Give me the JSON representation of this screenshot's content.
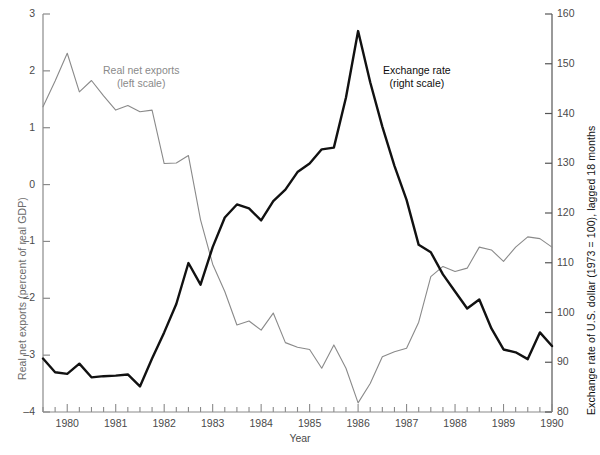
{
  "chart_data": {
    "type": "line",
    "title": "",
    "xlabel": "Year",
    "ylabel": "Real net exports (percent of real GDP)",
    "ylabel_right": "Exchange rate of U.S. dollar (1973 = 100), lagged 18 months",
    "xlim": [
      1979.5,
      1990.0
    ],
    "ylim": [
      -4,
      3
    ],
    "ylim_right": [
      80,
      160
    ],
    "grid": false,
    "legend_position": "inline-annotations",
    "x_ticks_major": [
      "1980",
      "1981",
      "1982",
      "1983",
      "1984",
      "1985",
      "1986",
      "1987",
      "1988",
      "1989",
      "1990"
    ],
    "x_tick_interval_minor": "quarterly",
    "y_ticks_left": [
      "3",
      "2",
      "1",
      "0",
      "–1",
      "–2",
      "–3",
      "–4"
    ],
    "y_ticks_right": [
      "160",
      "150",
      "140",
      "130",
      "120",
      "110",
      "100",
      "90",
      "80"
    ],
    "series": [
      {
        "name": "Real net exports (left scale)",
        "axis": "left",
        "color": "#8a8a8a",
        "label_line1": "Real net exports",
        "label_line2": "(left scale)",
        "x": [
          1979.5,
          1979.75,
          1980.0,
          1980.25,
          1980.5,
          1980.75,
          1981.0,
          1981.25,
          1981.5,
          1981.75,
          1982.0,
          1982.25,
          1982.5,
          1982.75,
          1983.0,
          1983.25,
          1983.5,
          1983.75,
          1984.0,
          1984.25,
          1984.5,
          1984.75,
          1985.0,
          1985.25,
          1985.5,
          1985.75,
          1986.0,
          1986.25,
          1986.5,
          1986.75,
          1987.0,
          1987.25,
          1987.5,
          1987.75,
          1988.0,
          1988.25,
          1988.5,
          1988.75,
          1989.0,
          1989.25,
          1989.5,
          1989.75,
          1990.0
        ],
        "y": [
          1.37,
          1.82,
          2.31,
          1.63,
          1.83,
          1.56,
          1.31,
          1.39,
          1.28,
          1.31,
          0.37,
          0.38,
          0.51,
          -0.62,
          -1.4,
          -1.88,
          -2.47,
          -2.4,
          -2.56,
          -2.26,
          -2.78,
          -2.86,
          -2.9,
          -3.23,
          -2.82,
          -3.23,
          -3.84,
          -3.5,
          -3.03,
          -2.94,
          -2.88,
          -2.42,
          -1.62,
          -1.44,
          -1.53,
          -1.47,
          -1.1,
          -1.15,
          -1.35,
          -1.1,
          -0.92,
          -0.95,
          -1.1
        ]
      },
      {
        "name": "Exchange rate (right scale)",
        "axis": "right",
        "color": "#111111",
        "label_line1": "Exchange rate",
        "label_line2": "(right scale)",
        "x": [
          1979.5,
          1979.75,
          1980.0,
          1980.25,
          1980.5,
          1980.75,
          1981.0,
          1981.25,
          1981.5,
          1981.75,
          1982.0,
          1982.25,
          1982.5,
          1982.75,
          1983.0,
          1983.25,
          1983.5,
          1983.75,
          1984.0,
          1984.25,
          1984.5,
          1984.75,
          1985.0,
          1985.25,
          1985.5,
          1985.75,
          1986.0,
          1986.25,
          1986.5,
          1986.75,
          1987.0,
          1987.25,
          1987.5,
          1987.75,
          1988.0,
          1988.25,
          1988.5,
          1988.75,
          1989.0,
          1989.25,
          1989.5,
          1989.75,
          1990.0
        ],
        "y_left_units": [
          -3.06,
          -3.3,
          -3.33,
          -3.15,
          -3.39,
          -3.37,
          -3.36,
          -3.34,
          -3.55,
          -3.06,
          -2.6,
          -2.1,
          -1.38,
          -1.76,
          -1.1,
          -0.58,
          -0.35,
          -0.42,
          -0.63,
          -0.29,
          -0.09,
          0.22,
          0.37,
          0.62,
          0.65,
          1.53,
          2.7,
          1.8,
          1.02,
          0.33,
          -0.27,
          -1.06,
          -1.19,
          -1.58,
          -1.88,
          -2.18,
          -2.02,
          -2.53,
          -2.9,
          -2.95,
          -3.07,
          -2.6,
          -2.84
        ],
        "y": [
          90.7,
          88.0,
          87.6,
          89.6,
          86.9,
          87.1,
          87.2,
          87.4,
          85.1,
          90.7,
          95.9,
          101.6,
          109.9,
          105.6,
          113.1,
          119.1,
          121.7,
          120.9,
          118.5,
          122.4,
          124.7,
          128.3,
          130.0,
          132.8,
          133.1,
          143.2,
          156.6,
          146.3,
          137.4,
          129.5,
          122.6,
          113.6,
          112.1,
          107.7,
          104.3,
          100.9,
          102.7,
          96.8,
          92.6,
          92.0,
          90.6,
          96.0,
          93.3
        ]
      }
    ]
  },
  "annotations": {
    "netexports": {
      "line1": "Real net exports",
      "line2": "(left scale)"
    },
    "exchange": {
      "line1": "Exchange rate",
      "line2": "(right scale)"
    }
  },
  "axes": {
    "x_title": "Year",
    "y_left_title": "Real net exports (percent of real GDP)",
    "y_right_title": "Exchange rate of U.S. dollar (1973 = 100), lagged 18 months"
  }
}
